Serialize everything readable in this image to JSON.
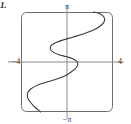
{
  "figure": {
    "number_label": "1.",
    "caption": ""
  },
  "plot": {
    "frame": {
      "x_min_px": 21,
      "y_min_px": 12,
      "x_max_px": 113,
      "y_max_px": 112,
      "corner_radius_px": 5,
      "border_color": "#6e6e6e",
      "background_color": "#ffffff"
    },
    "axes": {
      "origin_x_px": 67,
      "origin_y_px": 62,
      "axis_color": "#8a8a8a",
      "curve_color": "#3a3a3a"
    },
    "labels": {
      "top": "π",
      "bottom": "−π",
      "left": "−4",
      "right": "4"
    }
  },
  "chart_data": {
    "type": "line",
    "title": "",
    "subtitle": "",
    "xlabel": "",
    "ylabel": "",
    "xlim": [
      -4,
      4
    ],
    "ylim": [
      -3.14159,
      3.14159
    ],
    "grid": false,
    "legend": null,
    "x_ticks": [
      -4,
      4
    ],
    "x_tick_labels": [
      "−4",
      "4"
    ],
    "y_ticks": [
      -3.14159,
      3.14159
    ],
    "y_tick_labels": [
      "−π",
      "π"
    ],
    "annotations": [],
    "series": [
      {
        "name": "curve",
        "description": "odd-symmetric snaking relation, x oscillates as y increases",
        "points": [
          [
            -2.3,
            -3.14159
          ],
          [
            -2.95,
            -2.72
          ],
          [
            -3.35,
            -2.36
          ],
          [
            -3.45,
            -2.05
          ],
          [
            -3.25,
            -1.76
          ],
          [
            -2.7,
            -1.5
          ],
          [
            -1.95,
            -1.3
          ],
          [
            -1.15,
            -1.13
          ],
          [
            -0.45,
            -0.96
          ],
          [
            0.05,
            -0.78
          ],
          [
            0.45,
            -0.58
          ],
          [
            0.8,
            -0.36
          ],
          [
            0.95,
            -0.14
          ],
          [
            0.82,
            0.06
          ],
          [
            0.45,
            0.22
          ],
          [
            -0.1,
            0.34
          ],
          [
            -0.7,
            0.46
          ],
          [
            -1.2,
            0.62
          ],
          [
            -1.45,
            0.82
          ],
          [
            -1.38,
            1.03
          ],
          [
            -1.0,
            1.21
          ],
          [
            -0.35,
            1.38
          ],
          [
            0.5,
            1.56
          ],
          [
            1.4,
            1.76
          ],
          [
            2.25,
            1.99
          ],
          [
            2.9,
            2.26
          ],
          [
            3.25,
            2.56
          ],
          [
            3.2,
            2.84
          ],
          [
            2.8,
            3.05
          ],
          [
            2.3,
            3.14159
          ]
        ]
      }
    ]
  }
}
